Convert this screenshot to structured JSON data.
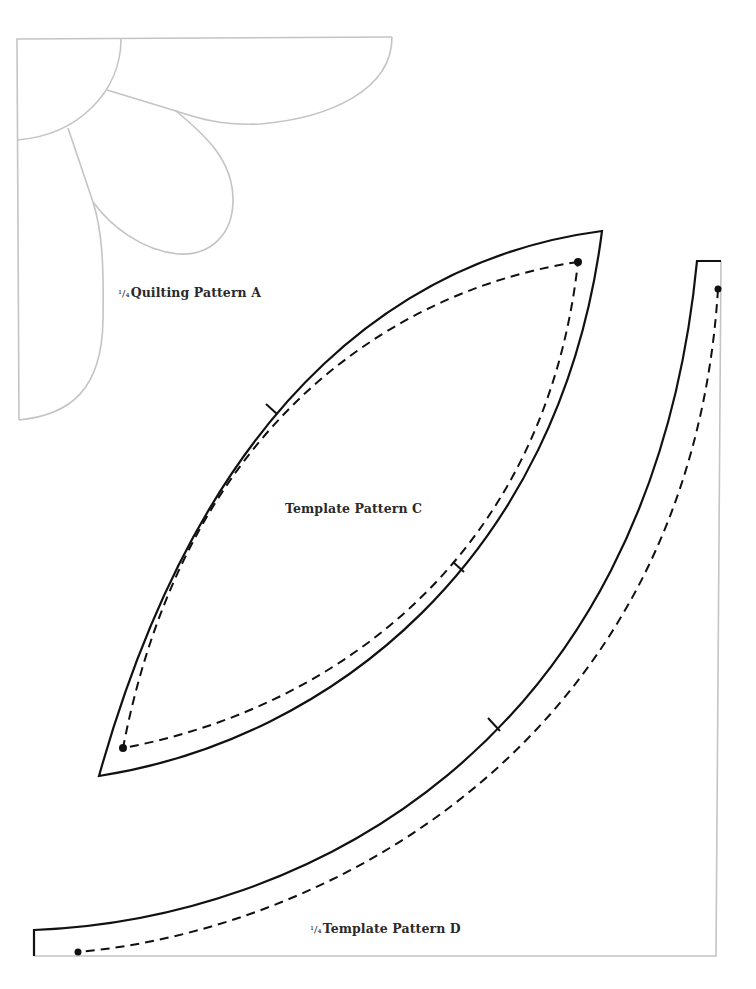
{
  "patterns": {
    "quilting_a": {
      "fraction": "1/4",
      "fraction_display": "¹/₄",
      "title": "Quilting Pattern A",
      "line_color": "#c4c4c4"
    },
    "template_c": {
      "title": "Template Pattern C",
      "cut_line_color": "#111111",
      "sew_line_style": "dashed"
    },
    "template_d": {
      "fraction": "1/4",
      "fraction_display": "¹/₄",
      "title": "Template Pattern D",
      "cut_line_color": "#111111",
      "fold_line_color": "#c4c4c4"
    }
  }
}
